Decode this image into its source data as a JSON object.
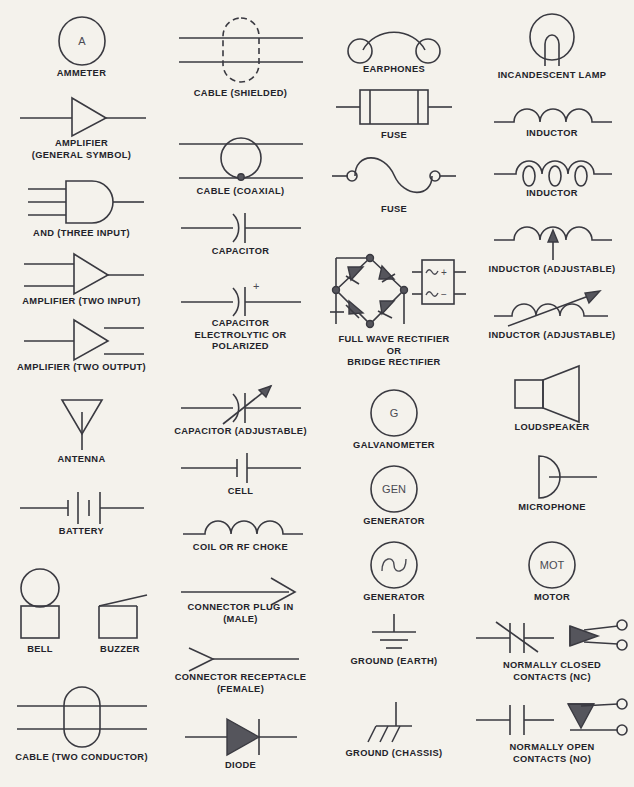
{
  "page": {
    "background_color": "#f4f2ec",
    "line_color": "#3a3a41",
    "text_color": "#23232a",
    "columns": 4,
    "symbol_count": 32
  },
  "columns": [
    {
      "index": 1,
      "items": [
        {
          "id": "ammeter",
          "label": "AMMETER",
          "glyph_text": "A"
        },
        {
          "id": "amplifier-general",
          "label": "AMPLIFIER\n(GENERAL SYMBOL)"
        },
        {
          "id": "and-three-input",
          "label": "AND (THREE INPUT)"
        },
        {
          "id": "amplifier-two-input",
          "label": "AMPLIFIER (TWO INPUT)"
        },
        {
          "id": "amplifier-two-output",
          "label": "AMPLIFIER (TWO OUTPUT)"
        },
        {
          "id": "antenna",
          "label": "ANTENNA"
        },
        {
          "id": "battery",
          "label": "BATTERY"
        },
        {
          "id": "bell",
          "label": "BELL"
        },
        {
          "id": "buzzer",
          "label": "BUZZER"
        },
        {
          "id": "cable-two-conductor",
          "label": "CABLE (TWO CONDUCTOR)"
        }
      ]
    },
    {
      "index": 2,
      "items": [
        {
          "id": "cable-shielded",
          "label": "CABLE (SHIELDED)"
        },
        {
          "id": "cable-coaxial",
          "label": "CABLE (COAXIAL)"
        },
        {
          "id": "capacitor",
          "label": "CAPACITOR"
        },
        {
          "id": "capacitor-electrolytic",
          "label": "CAPACITOR\nELECTROLYTIC OR\nPOLARIZED",
          "glyph_text": "+"
        },
        {
          "id": "capacitor-adjustable",
          "label": "CAPACITOR (ADJUSTABLE)"
        },
        {
          "id": "cell",
          "label": "CELL"
        },
        {
          "id": "coil-rf-choke",
          "label": "COIL OR RF CHOKE"
        },
        {
          "id": "connector-plug-male",
          "label": "CONNECTOR PLUG IN\n(MALE)"
        },
        {
          "id": "connector-receptacle-female",
          "label": "CONNECTOR RECEPTACLE\n(FEMALE)"
        },
        {
          "id": "diode",
          "label": "DIODE"
        }
      ]
    },
    {
      "index": 3,
      "items": [
        {
          "id": "earphones",
          "label": "EARPHONES"
        },
        {
          "id": "fuse-box",
          "label": "FUSE"
        },
        {
          "id": "fuse-s-curve",
          "label": "FUSE"
        },
        {
          "id": "full-wave-rectifier",
          "label": "FULL WAVE RECTIFIER\nOR\nBRIDGE RECTIFIER",
          "glyph_text": "+ −"
        },
        {
          "id": "galvanometer",
          "label": "GALVANOMETER",
          "glyph_text": "G"
        },
        {
          "id": "generator-gen",
          "label": "GENERATOR",
          "glyph_text": "GEN"
        },
        {
          "id": "generator-sine",
          "label": "GENERATOR"
        },
        {
          "id": "ground-earth",
          "label": "GROUND (EARTH)"
        },
        {
          "id": "ground-chassis",
          "label": "GROUND (CHASSIS)"
        }
      ]
    },
    {
      "index": 4,
      "items": [
        {
          "id": "incandescent-lamp",
          "label": "INCANDESCENT LAMP"
        },
        {
          "id": "inductor-air-core",
          "label": "INDUCTOR"
        },
        {
          "id": "inductor-loops",
          "label": "INDUCTOR"
        },
        {
          "id": "inductor-adjustable-arrow",
          "label": "INDUCTOR (ADJUSTABLE)"
        },
        {
          "id": "inductor-adjustable-diagonal",
          "label": "INDUCTOR (ADJUSTABLE)"
        },
        {
          "id": "loudspeaker",
          "label": "LOUDSPEAKER"
        },
        {
          "id": "microphone",
          "label": "MICROPHONE"
        },
        {
          "id": "motor",
          "label": "MOTOR",
          "glyph_text": "MOT"
        },
        {
          "id": "normally-closed-contacts",
          "label": "NORMALLY CLOSED\nCONTACTS (NC)"
        },
        {
          "id": "normally-open-contacts",
          "label": "NORMALLY OPEN\nCONTACTS (NO)"
        }
      ]
    }
  ]
}
